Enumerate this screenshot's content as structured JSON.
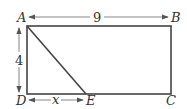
{
  "diagram": {
    "type": "rectangle-with-segment",
    "vertices": [
      {
        "label": "A",
        "position": "top-left"
      },
      {
        "label": "B",
        "position": "top-right"
      },
      {
        "label": "C",
        "position": "bottom-right"
      },
      {
        "label": "D",
        "position": "bottom-left"
      },
      {
        "label": "E",
        "position": "bottom, between D and C"
      }
    ],
    "segments": [
      {
        "from": "A",
        "to": "E",
        "description": "diagonal segment"
      }
    ],
    "dimensions": {
      "top": {
        "from": "A",
        "to": "B",
        "value": "9"
      },
      "left": {
        "from": "A",
        "to": "D",
        "value": "4"
      },
      "bottom_partial": {
        "from": "D",
        "to": "E",
        "value": "x"
      }
    },
    "colors": {
      "line": "#444444",
      "arrow": "#666666",
      "text": "#333333"
    }
  }
}
